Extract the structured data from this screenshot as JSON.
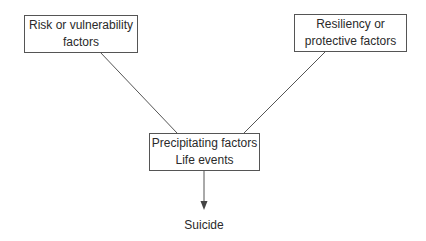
{
  "diagram": {
    "type": "flow",
    "nodes": [
      {
        "id": "risk",
        "lines": [
          "Risk or vulnerability",
          "factors"
        ]
      },
      {
        "id": "resiliency",
        "lines": [
          "Resiliency or",
          "protective factors"
        ]
      },
      {
        "id": "precipitating",
        "lines": [
          "Precipitating factors",
          "Life events"
        ]
      },
      {
        "id": "outcome",
        "lines": [
          "Suicide"
        ]
      }
    ],
    "edges": [
      {
        "from": "risk",
        "to": "precipitating",
        "style": "line"
      },
      {
        "from": "resiliency",
        "to": "precipitating",
        "style": "line"
      },
      {
        "from": "precipitating",
        "to": "outcome",
        "style": "arrow"
      }
    ]
  },
  "colors": {
    "stroke": "#555555",
    "text": "#2a2a2a",
    "background": "#ffffff"
  }
}
